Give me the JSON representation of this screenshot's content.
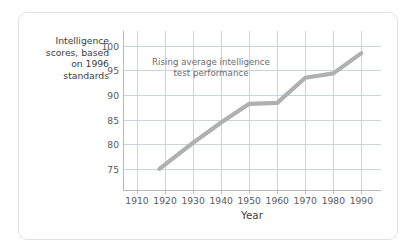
{
  "chart_data": {
    "type": "line",
    "title": "",
    "xlabel": "Year",
    "ylabel": "Intelligence scores, based on 1996 standards",
    "annotation": "Rising average intelligence test performance",
    "annotation_lines": [
      "Rising average intelligence",
      "test performance"
    ],
    "grid": true,
    "legend": "none",
    "xlim": [
      1905,
      1997
    ],
    "ylim": [
      70.5,
      103
    ],
    "xticks": [
      1910,
      1920,
      1930,
      1940,
      1950,
      1960,
      1970,
      1980,
      1990
    ],
    "yticks": [
      75,
      80,
      85,
      90,
      95,
      100
    ],
    "xtick_labels": [
      "1910",
      "1920",
      "1930",
      "1940",
      "1950",
      "1960",
      "1970",
      "1980",
      "1990"
    ],
    "ytick_labels": [
      "75",
      "80",
      "85",
      "90",
      "95",
      "100"
    ],
    "series": [
      {
        "name": "Average intelligence test performance",
        "color": "#b0b0b0",
        "line_width": 4.2,
        "x": [
          1918,
          1930,
          1940,
          1950,
          1960,
          1970,
          1980,
          1990
        ],
        "values": [
          75.0,
          80.3,
          84.4,
          88.2,
          88.4,
          93.5,
          94.4,
          98.5
        ]
      }
    ]
  },
  "y_axis_title_lines": [
    "Intelligence",
    "scores, based",
    "on 1996",
    "standards"
  ],
  "colors": {
    "gridline": "#c9d4dd",
    "axis": "#b9b9b9",
    "series": "#b0b0b0",
    "tick_text": "#58595b",
    "title_text": "#3d3d3d",
    "annotation_text": "#6b6b6b",
    "card_border": "#e2e2e2",
    "background": "#ffffff"
  }
}
